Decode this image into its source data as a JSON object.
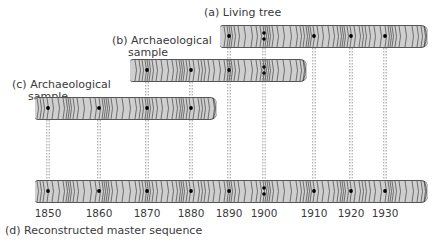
{
  "labels": {
    "a": "(a) Living tree",
    "b_line1": "(b) Archaeological",
    "b_line2": "sample",
    "c_line1": "(c) Archaeological",
    "c_line2": "sample",
    "d": "(d) Reconstructed master sequence"
  },
  "years": [
    "1850",
    "1860",
    "1870",
    "1880",
    "1890",
    "1900",
    "1910",
    "1920",
    "1930"
  ],
  "colors": {
    "bar_fill": "#cfcfcf",
    "ring_line": "#444444",
    "text": "#3a3a3a"
  },
  "samples": [
    {
      "id": "a",
      "name": "Living tree",
      "span_years": [
        "1890",
        "1930+"
      ]
    },
    {
      "id": "b",
      "name": "Archaeological sample",
      "span_years": [
        "1860",
        "1900+"
      ]
    },
    {
      "id": "c",
      "name": "Archaeological sample",
      "span_years": [
        "1848",
        "1880+"
      ]
    },
    {
      "id": "d",
      "name": "Reconstructed master sequence",
      "span_years": [
        "1848",
        "1930+"
      ]
    }
  ]
}
